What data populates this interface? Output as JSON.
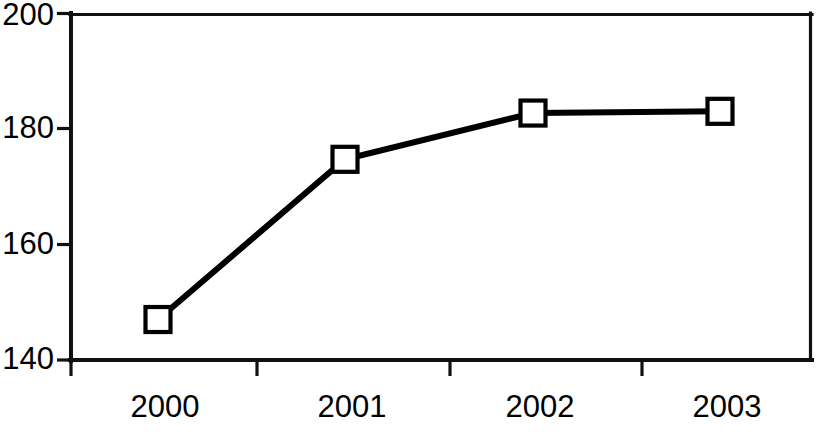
{
  "chart_data": {
    "type": "line",
    "title": "",
    "subtitle": "",
    "xlabel": "",
    "ylabel": "",
    "categories": [
      "2000",
      "2001",
      "2002",
      "2003"
    ],
    "values": [
      147,
      174.7,
      182.7,
      183
    ],
    "series": [
      {
        "name": "",
        "values": [
          147,
          174.7,
          182.7,
          183
        ]
      }
    ],
    "ylim": [
      140,
      200
    ],
    "ytick_labels": [
      "140",
      "160",
      "180",
      "200"
    ],
    "ytick_values": [
      140,
      160,
      180,
      200
    ],
    "xtick_labels": [
      "2000",
      "2001",
      "2002",
      "2003"
    ],
    "grid": false,
    "legend": false,
    "legend_position": "none",
    "marker": "open-square",
    "line_color": "#000000",
    "marker_fill": "#ffffff",
    "marker_edge_color": "#000000",
    "background_color": "#ffffff",
    "axis_color": "#111111",
    "annotations": []
  }
}
